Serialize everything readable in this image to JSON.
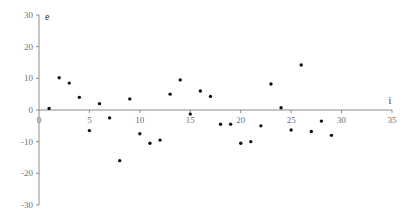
{
  "chart_data": {
    "type": "scatter",
    "title": "",
    "xlabel": "i",
    "ylabel": "e",
    "xlim": [
      0,
      35
    ],
    "ylim": [
      -30,
      30
    ],
    "x_ticks": [
      0,
      5,
      10,
      15,
      20,
      25,
      30,
      35
    ],
    "y_ticks": [
      -30,
      -20,
      -10,
      0,
      10,
      20,
      30
    ],
    "x_tick_labels": [
      "0",
      "5",
      "10",
      "15",
      "20",
      "25",
      "30",
      "35"
    ],
    "y_tick_labels": [
      "-30",
      "-20",
      "-10",
      "0",
      "10",
      "20",
      "30"
    ],
    "grid": false,
    "legend": "none",
    "series": [
      {
        "name": "residuals",
        "x": [
          1,
          2,
          3,
          4,
          5,
          6,
          7,
          8,
          9,
          10,
          11,
          12,
          13,
          14,
          15,
          16,
          17,
          18,
          19,
          20,
          21,
          22,
          23,
          24,
          25,
          26,
          27,
          28,
          29
        ],
        "y": [
          0.5,
          10.2,
          8.5,
          4,
          -6.5,
          2,
          -2.5,
          -16,
          3.5,
          -7.5,
          -10.5,
          -9.5,
          5,
          9.5,
          -1.3,
          6,
          4.3,
          -4.5,
          -4.5,
          -10.5,
          -10,
          -5,
          8.2,
          0.7,
          -6.3,
          14.2,
          -6.8,
          -3.5,
          -8
        ]
      }
    ],
    "colors": {
      "axis": "#8c8c8c",
      "point": "#111111",
      "label": "#707070"
    }
  }
}
